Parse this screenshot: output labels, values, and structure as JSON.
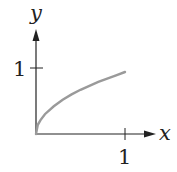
{
  "chart_data": {
    "type": "line",
    "title": "",
    "xlabel": "x",
    "ylabel": "y",
    "xlim": [
      0,
      1.15
    ],
    "ylim": [
      0,
      1.5
    ],
    "grid": false,
    "legend": null,
    "x_ticks": [
      1
    ],
    "x_tick_labels": [
      "1"
    ],
    "y_ticks": [
      1
    ],
    "y_tick_labels": [
      "1"
    ],
    "series": [
      {
        "name": "curve",
        "color": "#9a9a9a",
        "x": [
          0,
          0.02,
          0.05,
          0.1,
          0.2,
          0.3,
          0.4,
          0.5,
          0.6,
          0.7,
          0.8,
          0.9,
          1.0
        ],
        "y": [
          0,
          0.14,
          0.21,
          0.3,
          0.42,
          0.52,
          0.6,
          0.67,
          0.73,
          0.79,
          0.84,
          0.89,
          0.94
        ]
      }
    ]
  },
  "labels": {
    "x_axis": "x",
    "y_axis": "y",
    "x_tick": "1",
    "y_tick": "1"
  }
}
